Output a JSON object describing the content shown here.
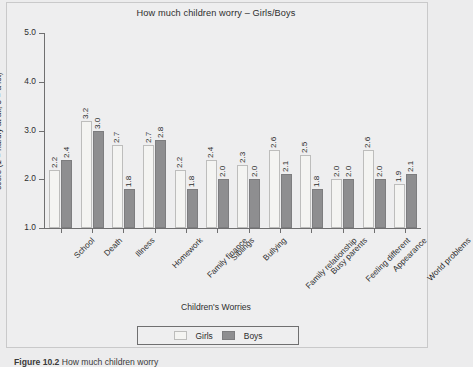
{
  "figure": {
    "caption_label": "Figure 10.2",
    "caption_text": "How much children worry"
  },
  "legend": {
    "position": "bottom-center",
    "entries": [
      {
        "label": "Girls",
        "color": "#f4f4f2"
      },
      {
        "label": "Boys",
        "color": "#8e8e90"
      }
    ]
  },
  "chart_data": {
    "type": "bar",
    "title": "How much children worry – Girls/Boys",
    "xlabel": "Children's Worries",
    "ylabel": "score (1 = hardly at all, 5 = a lot)",
    "ylim": [
      1.0,
      5.0
    ],
    "yticks": [
      "1.0",
      "2.0",
      "3.0",
      "4.0",
      "5.0"
    ],
    "ytick_values": [
      1.0,
      2.0,
      3.0,
      4.0,
      5.0
    ],
    "grid": false,
    "legend_position": "bottom-center",
    "categories": [
      "School",
      "Death",
      "Illness",
      "Homework",
      "Family finance",
      "Siblings",
      "Bullying",
      "Family relationship",
      "Busy parents",
      "Feeling different",
      "Appearance",
      "World problems"
    ],
    "series": [
      {
        "name": "Girls",
        "color": "#f4f4f2",
        "values": [
          2.2,
          3.2,
          2.7,
          2.7,
          2.2,
          2.4,
          2.3,
          2.6,
          2.5,
          2.0,
          2.6,
          1.9
        ],
        "labels": [
          "2.2",
          "3.2",
          "2.7",
          "2.7",
          "2.2",
          "2.4",
          "2.3",
          "2.6",
          "2.5",
          "2.0",
          "2.6",
          "1.9"
        ]
      },
      {
        "name": "Boys",
        "color": "#8e8e90",
        "values": [
          2.4,
          3.0,
          1.8,
          2.8,
          1.8,
          2.0,
          2.0,
          2.1,
          1.8,
          2.0,
          2.0,
          2.1
        ],
        "labels": [
          "2.4",
          "3.0",
          "1.8",
          "2.8",
          "1.8",
          "2.0",
          "2.0",
          "2.1",
          "1.8",
          "2.0",
          "2.0",
          "2.1"
        ]
      }
    ]
  }
}
